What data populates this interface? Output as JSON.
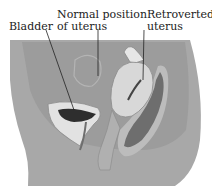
{
  "labels": {
    "bladder": "Bladder",
    "normal_position": [
      "Normal position",
      "of uterus"
    ],
    "retroverted": [
      "Retroverted",
      "uterus"
    ]
  },
  "colors": {
    "background": "#ffffff",
    "body_fill": "#a8a8a8",
    "abdomen_fill": "#9a9a9a",
    "organ_light": "#d8d8d8",
    "organ_mid": "#bdbdbd",
    "rectum_dark": "#6e6e6e",
    "bladder_inner": "#2e2e2e",
    "leader_line": "#222222"
  }
}
